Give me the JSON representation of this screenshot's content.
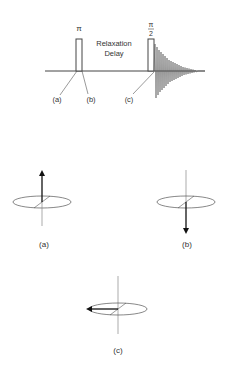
{
  "pulse_sequence": {
    "pi_pulse_label": "π",
    "pi_half_numerator": "π",
    "pi_half_denominator": "2",
    "delay_line1": "Relaxation",
    "delay_line2": "Delay",
    "point_labels": [
      "(a)",
      "(b)",
      "(c)"
    ]
  },
  "vectors": [
    {
      "label": "(a)",
      "direction": "up"
    },
    {
      "label": "(b)",
      "direction": "down"
    },
    {
      "label": "(c)",
      "direction": "left"
    }
  ],
  "colors": {
    "line": "#444444",
    "arrow": "#111111",
    "axis": "#888888"
  }
}
